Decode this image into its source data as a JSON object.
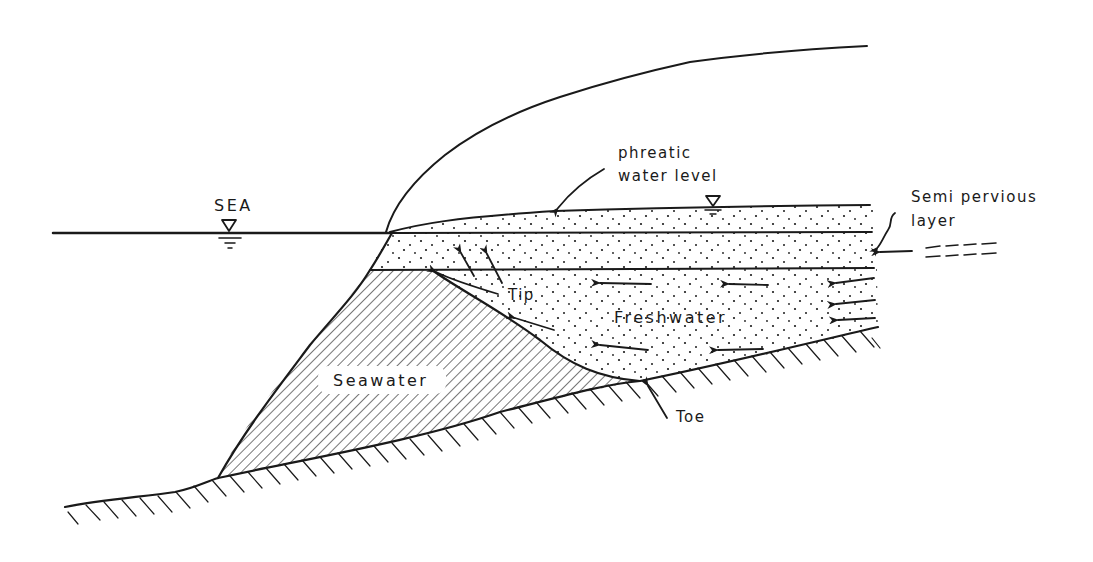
{
  "diagram": {
    "type": "cross-section",
    "labels": {
      "sea": "SEA",
      "phreatic_line1": "phreatic",
      "phreatic_line2": "water level",
      "semi_line1": "Semi pervious",
      "semi_line2": "layer",
      "tip": "Tip",
      "freshwater": "Freshwater",
      "seawater": "Seawater",
      "toe": "Toe"
    },
    "regions": [
      {
        "name": "Seawater wedge",
        "fill": "diagonal hatch"
      },
      {
        "name": "Freshwater zone",
        "fill": "stippled dots"
      },
      {
        "name": "Upper phreatic aquifer",
        "fill": "stippled dots"
      },
      {
        "name": "Semi pervious layer",
        "fill": "dashed lines"
      },
      {
        "name": "Impermeable base",
        "fill": "ground hatch"
      }
    ],
    "symbols": {
      "sea_level_marker": "water-level-triangle",
      "phreatic_level_marker": "water-level-triangle"
    },
    "colors": {
      "ink": "#1a1a1a",
      "background": "#ffffff"
    }
  }
}
